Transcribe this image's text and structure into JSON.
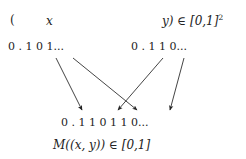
{
  "figure": {
    "background_color": "#ffffff",
    "ink_color": "#242424",
    "width": 246,
    "height": 159
  },
  "pair_line": {
    "open_paren": "(",
    "x_symbol": "x",
    "y_and_domain": "y) ∈ [0,1]",
    "domain_exponent": "2"
  },
  "expansions": {
    "x_binary": "0 . 1 0 1...",
    "y_binary": "0 . 1 1 0...",
    "interleaved_binary": "0 . 1 1 0 1 1 0..."
  },
  "result_label": {
    "text": "M((x, y)) ∈ [0,1]"
  },
  "chart_data": {
    "type": "diagram",
    "inputs": [
      {
        "name": "x",
        "digits": [
          "1",
          "0",
          "1"
        ],
        "binary": "0 . 1 0 1..."
      },
      {
        "name": "y",
        "digits": [
          "1",
          "1",
          "0"
        ],
        "binary": "0 . 1 1 0..."
      }
    ],
    "output": {
      "name": "M((x,y))",
      "digits": [
        "1",
        "1",
        "0",
        "1",
        "1",
        "0"
      ],
      "binary": "0 . 1 1 0 1 1 0..."
    },
    "arrows": [
      {
        "from": "x.1",
        "to": "out.1",
        "x1": 56,
        "y1": 58,
        "x2": 82,
        "y2": 110
      },
      {
        "from": "x.2",
        "to": "out.3",
        "x1": 73,
        "y1": 58,
        "x2": 137,
        "y2": 110
      },
      {
        "from": "y.1",
        "to": "out.2",
        "x1": 163,
        "y1": 58,
        "x2": 118,
        "y2": 110
      },
      {
        "from": "y.2",
        "to": "out.4",
        "x1": 184,
        "y1": 58,
        "x2": 170,
        "y2": 110
      }
    ]
  }
}
